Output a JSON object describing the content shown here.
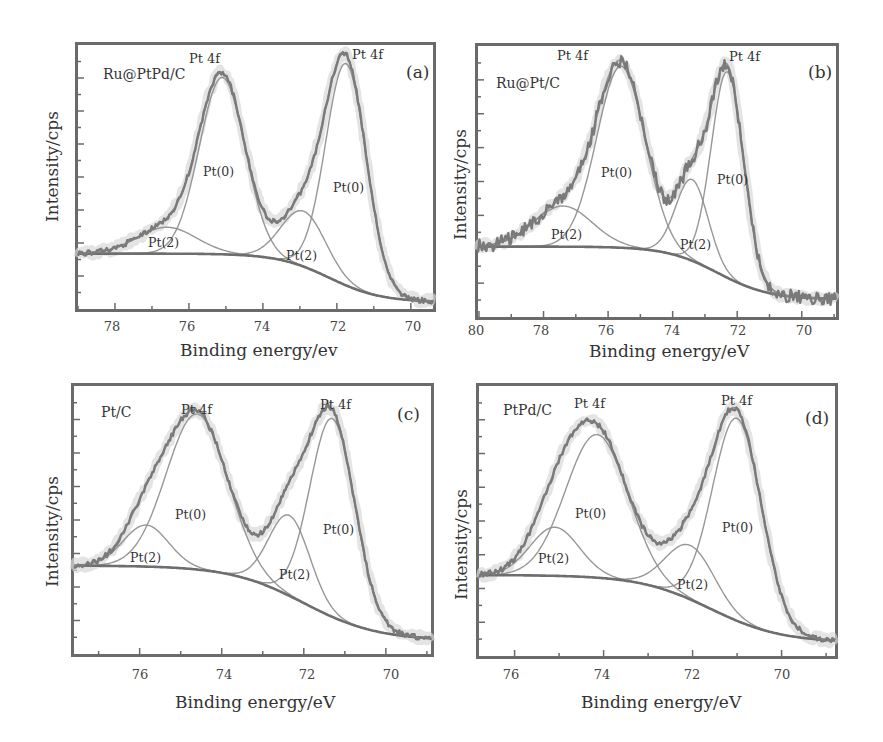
{
  "chart_data": [
    {
      "id": "a",
      "type": "line",
      "panel_label": "(a)",
      "sample": "Ru@PtPd/C",
      "title": "",
      "xlabel": "Binding energy/ev",
      "ylabel": "Intensity/cps",
      "xlim": [
        79.0,
        69.4
      ],
      "x_reversed": true,
      "ylim": [
        0,
        100
      ],
      "xticks": [
        78,
        76,
        74,
        72,
        70
      ],
      "yticks_labeled": false,
      "grid": false,
      "annotations": [
        "Pt 4f",
        "Pt 4f",
        "Pt(0)",
        "Pt(0)",
        "Pt(2)",
        "Pt(2)"
      ],
      "background": {
        "high": 21,
        "low": 2.6,
        "center": 72.2,
        "width": 0.7
      },
      "peaks": [
        {
          "label": "Pt(0)",
          "center_eV": 75.1,
          "amplitude": 67,
          "sigma": 0.62
        },
        {
          "label": "Pt(0)",
          "center_eV": 71.75,
          "amplitude": 84,
          "sigma": 0.55
        },
        {
          "label": "Pt(2)",
          "center_eV": 76.6,
          "amplitude": 10,
          "sigma": 0.8
        },
        {
          "label": "Pt(2)",
          "center_eV": 72.9,
          "amplitude": 21,
          "sigma": 0.6
        }
      ],
      "series": [
        {
          "name": "Raw data",
          "style": "noisy"
        },
        {
          "name": "Fit envelope",
          "style": "smooth"
        },
        {
          "name": "Pt(0) components",
          "style": "thin"
        },
        {
          "name": "Pt(2) components",
          "style": "thin"
        },
        {
          "name": "Background",
          "style": "thick"
        }
      ]
    },
    {
      "id": "b",
      "type": "line",
      "panel_label": "(b)",
      "sample": "Ru@Pt/C",
      "title": "",
      "xlabel": "Binding energy/eV",
      "ylabel": "Intensity/cps",
      "xlim": [
        80.03,
        68.94
      ],
      "x_reversed": true,
      "ylim": [
        0,
        100
      ],
      "xticks": [
        80,
        78,
        76,
        74,
        72,
        70
      ],
      "yticks_labeled": false,
      "grid": false,
      "annotations": [
        "Pt 4f",
        "Pt 4f",
        "Pt(0)",
        "Pt(0)",
        "Pt(2)",
        "Pt(2)"
      ],
      "background": {
        "high": 26,
        "low": 6.5,
        "center": 72.6,
        "width": 0.8
      },
      "peaks": [
        {
          "label": "Pt(0)",
          "center_eV": 75.6,
          "amplitude": 67,
          "sigma": 0.75
        },
        {
          "label": "Pt(0)",
          "center_eV": 72.3,
          "amplitude": 76,
          "sigma": 0.5
        },
        {
          "label": "Pt(2)",
          "center_eV": 77.4,
          "amplitude": 15,
          "sigma": 0.9
        },
        {
          "label": "Pt(2)",
          "center_eV": 73.4,
          "amplitude": 30,
          "sigma": 0.5
        }
      ],
      "series": [
        {
          "name": "Raw data",
          "style": "noisy"
        },
        {
          "name": "Fit envelope",
          "style": "smooth"
        },
        {
          "name": "Pt(0) components",
          "style": "thin"
        },
        {
          "name": "Pt(2) components",
          "style": "thin"
        },
        {
          "name": "Background",
          "style": "thick"
        }
      ]
    },
    {
      "id": "c",
      "type": "line",
      "panel_label": "(c)",
      "sample": "Pt/C",
      "title": "",
      "xlabel": "Binding energy/eV",
      "ylabel": "Intensity/cps",
      "xlim": [
        77.6,
        68.9
      ],
      "x_reversed": true,
      "ylim": [
        0,
        100
      ],
      "xticks": [
        76,
        74,
        72,
        70
      ],
      "yticks_labeled": false,
      "grid": false,
      "annotations": [
        "Pt 4f",
        "Pt 4f",
        "Pt(0)",
        "Pt(0)",
        "Pt(2)",
        "Pt(2)"
      ],
      "background": {
        "high": 33,
        "low": 5,
        "center": 72.0,
        "width": 0.9
      },
      "peaks": [
        {
          "label": "Pt(0)",
          "center_eV": 74.6,
          "amplitude": 58,
          "sigma": 0.75
        },
        {
          "label": "Pt(0)",
          "center_eV": 71.3,
          "amplitude": 74,
          "sigma": 0.55
        },
        {
          "label": "Pt(2)",
          "center_eV": 75.85,
          "amplitude": 15.5,
          "sigma": 0.55
        },
        {
          "label": "Pt(2)",
          "center_eV": 72.35,
          "amplitude": 30,
          "sigma": 0.5
        }
      ],
      "series": [
        {
          "name": "Raw data",
          "style": "noisy"
        },
        {
          "name": "Fit envelope",
          "style": "smooth"
        },
        {
          "name": "Pt(0) components",
          "style": "thin"
        },
        {
          "name": "Pt(2) components",
          "style": "thin"
        },
        {
          "name": "Background",
          "style": "thick"
        }
      ]
    },
    {
      "id": "d",
      "type": "line",
      "panel_label": "(d)",
      "sample": "PtPd/C",
      "title": "",
      "xlabel": "Binding energy/eV",
      "ylabel": "Intensity/cps",
      "xlim": [
        76.8,
        68.8
      ],
      "x_reversed": true,
      "ylim": [
        0,
        100
      ],
      "xticks": [
        76,
        74,
        72,
        70
      ],
      "yticks_labeled": false,
      "grid": false,
      "annotations": [
        "Pt 4f",
        "Pt 4f",
        "Pt(0)",
        "Pt(0)",
        "Pt(2)",
        "Pt(2)"
      ],
      "background": {
        "high": 30,
        "low": 5,
        "center": 71.6,
        "width": 0.8
      },
      "peaks": [
        {
          "label": "Pt(0)",
          "center_eV": 74.15,
          "amplitude": 53,
          "sigma": 0.7
        },
        {
          "label": "Pt(0)",
          "center_eV": 71.0,
          "amplitude": 75,
          "sigma": 0.55
        },
        {
          "label": "Pt(2)",
          "center_eV": 75.1,
          "amplitude": 18,
          "sigma": 0.55
        },
        {
          "label": "Pt(2)",
          "center_eV": 72.05,
          "amplitude": 20,
          "sigma": 0.55
        }
      ],
      "series": [
        {
          "name": "Raw data",
          "style": "noisy"
        },
        {
          "name": "Fit envelope",
          "style": "smooth"
        },
        {
          "name": "Pt(0) components",
          "style": "thin"
        },
        {
          "name": "Pt(2) components",
          "style": "thin"
        },
        {
          "name": "Background",
          "style": "thick"
        }
      ]
    }
  ],
  "panels": {
    "a": {
      "letter": "(a)",
      "sample": "Ru@PtPd/C",
      "pt4f_left": "Pt 4f",
      "pt4f_right": "Pt 4f",
      "pt0_left": "Pt(0)",
      "pt0_right": "Pt(0)",
      "pt2_left": "Pt(2)",
      "pt2_right": "Pt(2)",
      "ylabel": "Intensity/cps",
      "xlabel": "Binding energy/ev",
      "ticks": [
        "78",
        "76",
        "74",
        "72",
        "70"
      ]
    },
    "b": {
      "letter": "(b)",
      "sample": "Ru@Pt/C",
      "pt4f_left": "Pt 4f",
      "pt4f_right": "Pt 4f",
      "pt0_left": "Pt(0)",
      "pt0_right": "Pt(0)",
      "pt2_left": "Pt(2)",
      "pt2_right": "Pt(2)",
      "ylabel": "Intensity/cps",
      "xlabel": "Binding energy/eV",
      "ticks": [
        "80",
        "78",
        "76",
        "74",
        "72",
        "70"
      ]
    },
    "c": {
      "letter": "(c)",
      "sample": "Pt/C",
      "pt4f_left": "Pt 4f",
      "pt4f_right": "Pt 4f",
      "pt0_left": "Pt(0)",
      "pt0_right": "Pt(0)",
      "pt2_left": "Pt(2)",
      "pt2_right": "Pt(2)",
      "ylabel": "Intensity/cps",
      "xlabel": "Binding energy/eV",
      "ticks": [
        "76",
        "74",
        "72",
        "70"
      ]
    },
    "d": {
      "letter": "(d)",
      "sample": "PtPd/C",
      "pt4f_left": "Pt 4f",
      "pt4f_right": "Pt 4f",
      "pt0_left": "Pt(0)",
      "pt0_right": "Pt(0)",
      "pt2_left": "Pt(2)",
      "pt2_right": "Pt(2)",
      "ylabel": "Intensity/cps",
      "xlabel": "Binding energy/eV",
      "ticks": [
        "76",
        "74",
        "72",
        "70"
      ]
    }
  },
  "colors": {
    "frame": "#6a6a6a",
    "data": "#7a7a7a",
    "fit": "#8a8a8a",
    "component": "#8c8c8c",
    "background": "#6e6e6e",
    "halo": "#d9d9d9"
  }
}
